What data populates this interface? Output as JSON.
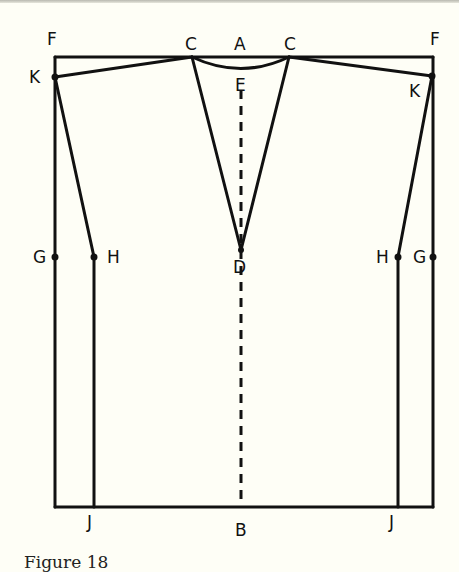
{
  "figure": {
    "caption": "Figure 18",
    "labels": {
      "F_left": "F",
      "F_right": "F",
      "C_left": "C",
      "A": "A",
      "C_right": "C",
      "E": "E",
      "K_left": "K",
      "K_right": "K",
      "G_left": "G",
      "H_left": "H",
      "D": "D",
      "H_right": "H",
      "G_right": "G",
      "J_left": "J",
      "B": "B",
      "J_right": "J"
    },
    "colors": {
      "ink": "#111111",
      "paper": "#fefef6"
    }
  }
}
